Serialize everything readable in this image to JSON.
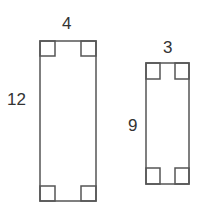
{
  "diagram": {
    "stroke_color": "#555555",
    "rectangles": [
      {
        "name": "large-rectangle",
        "width_label": "4",
        "height_label": "12",
        "box": {
          "x": 40,
          "y": 41,
          "w": 56,
          "h": 160
        },
        "corner": 15
      },
      {
        "name": "small-rectangle",
        "width_label": "3",
        "height_label": "9",
        "box": {
          "x": 146,
          "y": 63,
          "w": 43,
          "h": 121
        },
        "corner_w": 14,
        "corner_h": 16
      }
    ]
  }
}
